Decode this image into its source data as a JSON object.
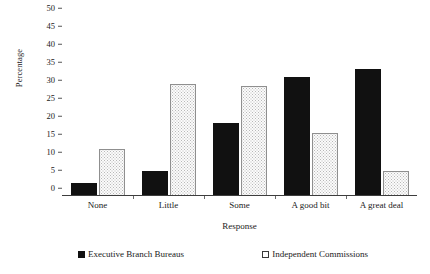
{
  "chart_data": {
    "type": "bar",
    "title": "",
    "xlabel": "Response",
    "ylabel": "Percentage",
    "categories": [
      "None",
      "Little",
      "Some",
      "A good bit",
      "A great deal"
    ],
    "series": [
      {
        "name": "Executive Branch Bureaus",
        "color": "#111111",
        "values": [
          3.5,
          7.0,
          20.3,
          33.0,
          35.2
        ]
      },
      {
        "name": "Independent Commissions",
        "color": "#fbfbfb",
        "values": [
          13.0,
          31.0,
          30.5,
          17.5,
          7.0
        ]
      }
    ],
    "ylim": [
      0,
      50
    ],
    "ytick_step": 5,
    "yticks": [
      "50",
      "45",
      "40",
      "35",
      "30",
      "25",
      "20",
      "15",
      "10",
      "5",
      "0"
    ],
    "grid": false,
    "legend_position": "bottom"
  },
  "legend": {
    "items": [
      {
        "label": "Executive Branch Bureaus",
        "swatch": "filled-black-square"
      },
      {
        "label": "Independent Commissions",
        "swatch": "open-white-square"
      }
    ]
  }
}
